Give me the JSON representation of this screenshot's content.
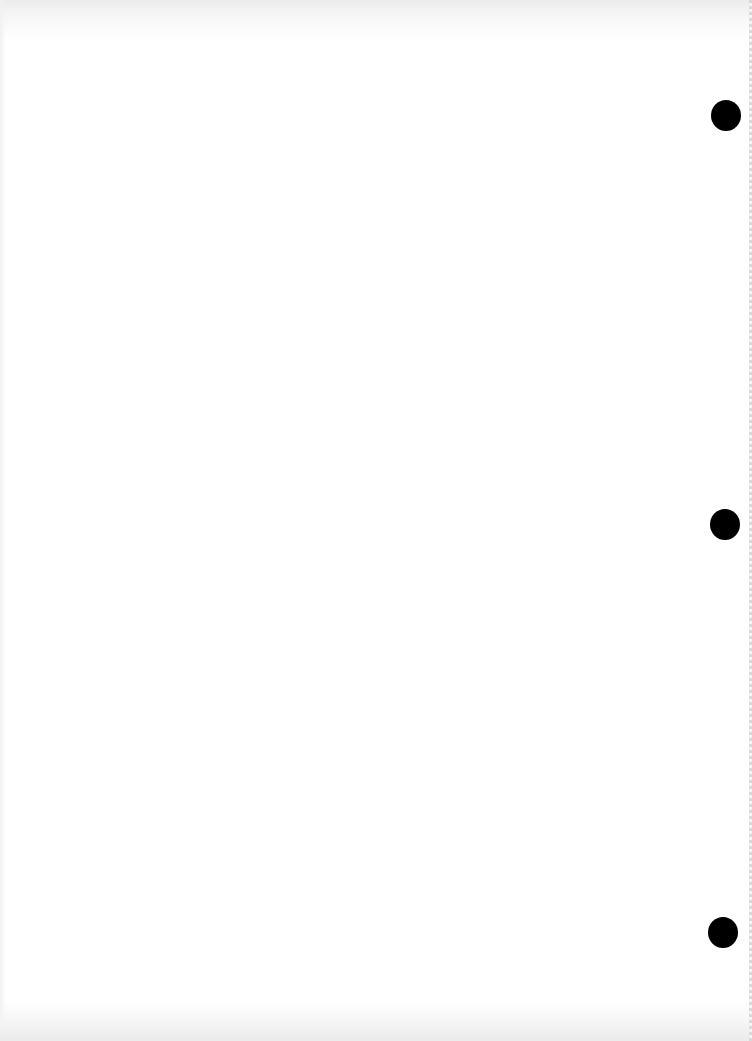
{
  "document": {
    "type": "blank scanned page",
    "text": "",
    "punch_holes": [
      {
        "cx": 726,
        "cy": 115,
        "w": 30,
        "h": 31
      },
      {
        "cx": 725,
        "cy": 524,
        "w": 30,
        "h": 31
      },
      {
        "cx": 723,
        "cy": 932,
        "w": 30,
        "h": 31
      }
    ],
    "colors": {
      "paper": "#ffffff",
      "hole": "#000000",
      "edge_shadow": "#ececec"
    }
  }
}
